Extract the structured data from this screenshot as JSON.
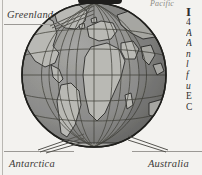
{
  "page": {
    "background_color": "#f3f2ef",
    "margin_rule_color": "#b9b7b2"
  },
  "map": {
    "type": "orthographic-globe",
    "projection": "orthographic",
    "center_description": "Atlantic Ocean / Africa",
    "ocean_color": "#8e8e8e",
    "land_color": "#b4b4b2",
    "graticule_color": "#4a4a48",
    "outline_color": "#2a2a28",
    "graticule": {
      "meridian_count": 13,
      "parallel_count": 5,
      "equator_visible": true
    }
  },
  "labels": {
    "greenland": "Greenland",
    "antarctica": "Antarctica",
    "australia": "Australia",
    "pacific": "Pacific"
  },
  "text_column": {
    "dropcap": "I",
    "lines": [
      "4",
      "A",
      "A",
      "n",
      "l",
      "f",
      "u",
      "E",
      "C"
    ]
  }
}
